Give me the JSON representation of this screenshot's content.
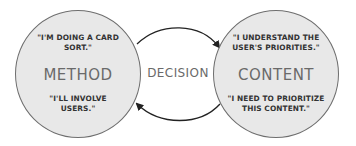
{
  "left_circle": {
    "top_quote_line1": "\"I'M DOING A CARD",
    "top_quote_line2": "SORT.\"",
    "title": "METHOD",
    "bottom_quote_line1": "\"I'LL INVOLVE",
    "bottom_quote_line2": "USERS.\""
  },
  "right_circle": {
    "top_quote_line1": "\"I UNDERSTAND THE",
    "top_quote_line2": "USER'S PRIORITIES.\"",
    "title": "CONTENT",
    "bottom_quote_line1": "\"I NEED TO PRIORITIZE",
    "bottom_quote_line2": "THIS CONTENT.\""
  },
  "center_label": "DECISION",
  "colors": {
    "circle_fill": "#e8e8e8",
    "circle_stroke": "#6e6e6e",
    "title": "#6a6a6a",
    "arrow": "#222222"
  }
}
